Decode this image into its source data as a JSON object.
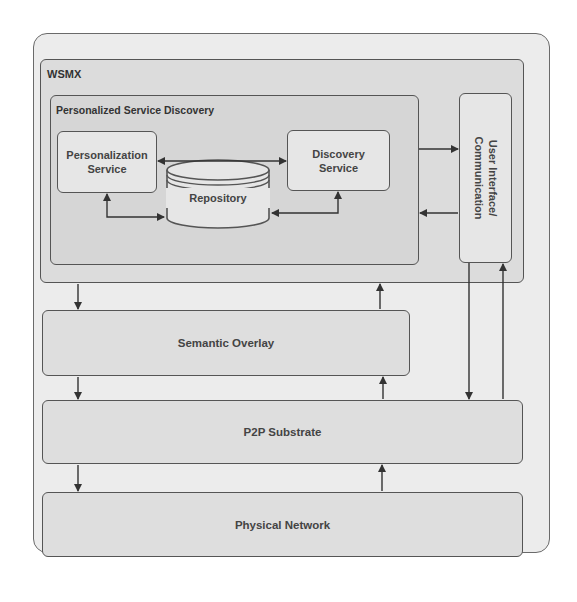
{
  "diagram": {
    "outer_container": {},
    "wsmx": {
      "title": "WSMX"
    },
    "personalized_service_discovery": {
      "title": "Personalized Service Discovery"
    },
    "components": {
      "personalization_service": {
        "line1": "Personalization",
        "line2": "Service"
      },
      "discovery_service": {
        "line1": "Discovery",
        "line2": "Service"
      },
      "repository": {
        "label": "Repository"
      },
      "user_interface": {
        "line1": "User Interface/",
        "line2": "Communication"
      }
    },
    "layers": {
      "semantic_overlay": "Semantic Overlay",
      "p2p_substrate": "P2P Substrate",
      "physical_network": "Physical Network"
    },
    "connections": [
      {
        "from": "Personalization Service",
        "to": "Discovery Service",
        "type": "bidirectional"
      },
      {
        "from": "Personalization Service",
        "to": "Repository",
        "type": "bidirectional"
      },
      {
        "from": "Discovery Service",
        "to": "Repository",
        "type": "bidirectional"
      },
      {
        "from": "Personalized Service Discovery",
        "to": "User Interface/Communication",
        "type": "directed"
      },
      {
        "from": "User Interface/Communication",
        "to": "Personalized Service Discovery",
        "type": "directed"
      },
      {
        "from": "WSMX",
        "to": "Semantic Overlay",
        "type": "directed"
      },
      {
        "from": "Semantic Overlay",
        "to": "WSMX",
        "type": "directed"
      },
      {
        "from": "Semantic Overlay",
        "to": "P2P Substrate",
        "type": "directed"
      },
      {
        "from": "P2P Substrate",
        "to": "Semantic Overlay",
        "type": "directed"
      },
      {
        "from": "User Interface/Communication",
        "to": "P2P Substrate",
        "type": "directed"
      },
      {
        "from": "P2P Substrate",
        "to": "User Interface/Communication",
        "type": "directed"
      },
      {
        "from": "P2P Substrate",
        "to": "Physical Network",
        "type": "directed"
      },
      {
        "from": "Physical Network",
        "to": "P2P Substrate",
        "type": "directed"
      }
    ],
    "colors": {
      "border": "#555555",
      "outer_fill": "#ececec",
      "wsmx_fill": "#dcdcdc",
      "component_fill": "#e6e6e6",
      "text": "#444444"
    }
  }
}
